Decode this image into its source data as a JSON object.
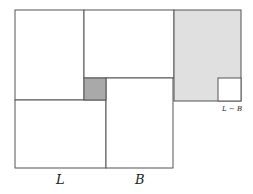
{
  "diagram": {
    "colors": {
      "stroke": "#555555",
      "white": "#ffffff",
      "light_grey": "#e0e0e0",
      "dark_grey": "#a9a9a9"
    },
    "labels": {
      "L": "L",
      "B": "B",
      "L_minus_B": "L − B"
    }
  }
}
